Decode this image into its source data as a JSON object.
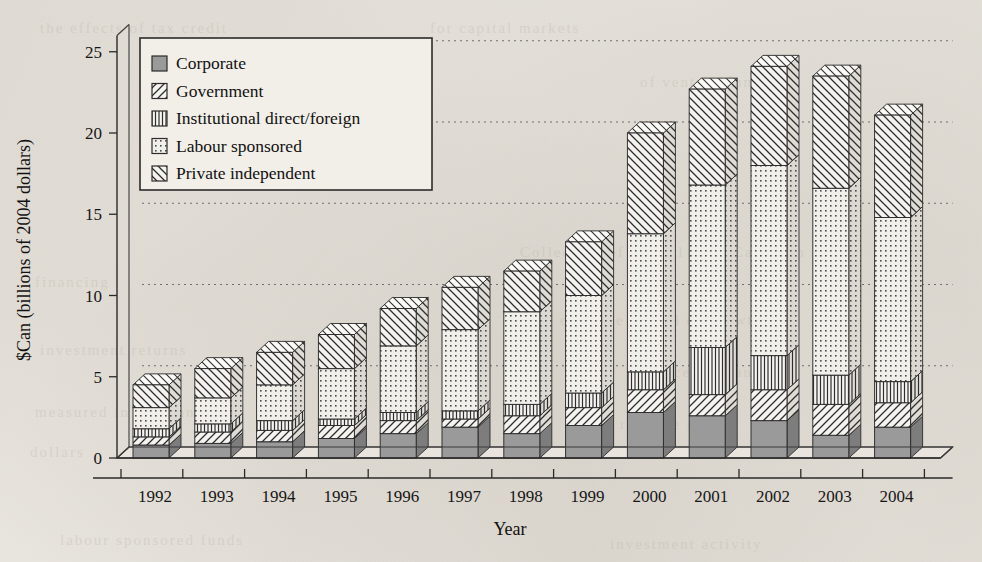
{
  "chart_data": {
    "type": "bar",
    "subtype": "stacked-bar-3d",
    "title": "",
    "xlabel": "Year",
    "ylabel": "$Can (billions of 2004 dollars)",
    "ylim": [
      0,
      26
    ],
    "yticks": [
      0,
      5,
      10,
      15,
      20,
      25
    ],
    "ytick_labels": [
      "0",
      "5",
      "10",
      "15",
      "20",
      "25"
    ],
    "grid": "horizontal-dotted",
    "legend_position": "top-left-inside",
    "categories": [
      "1992",
      "1993",
      "1994",
      "1995",
      "1996",
      "1997",
      "1998",
      "1999",
      "2000",
      "2001",
      "2002",
      "2003",
      "2004"
    ],
    "series": [
      {
        "name": "Corporate",
        "pattern": "solid-gray",
        "values": [
          0.8,
          0.9,
          1.0,
          1.2,
          1.5,
          1.9,
          1.5,
          2.0,
          2.8,
          2.6,
          2.3,
          1.4,
          1.9
        ]
      },
      {
        "name": "Government",
        "pattern": "diagonal-forward",
        "values": [
          0.5,
          0.7,
          0.7,
          0.8,
          0.8,
          0.5,
          1.1,
          1.1,
          1.4,
          1.3,
          1.9,
          1.9,
          1.5
        ]
      },
      {
        "name": "Institutional direct/foreign",
        "pattern": "vertical-bars",
        "values": [
          0.5,
          0.5,
          0.6,
          0.4,
          0.5,
          0.5,
          0.7,
          0.9,
          1.1,
          2.9,
          2.1,
          1.8,
          1.3
        ]
      },
      {
        "name": "Labour sponsored",
        "pattern": "dot-grid",
        "values": [
          1.3,
          1.6,
          2.2,
          3.1,
          4.1,
          5.0,
          5.7,
          6.0,
          8.5,
          10.0,
          11.7,
          11.5,
          10.1
        ]
      },
      {
        "name": "Private independent",
        "pattern": "diagonal-back",
        "values": [
          1.4,
          1.8,
          2.0,
          2.1,
          2.3,
          2.6,
          2.5,
          3.3,
          6.2,
          5.9,
          6.1,
          6.9,
          6.3
        ]
      }
    ],
    "totals": [
      4.5,
      5.5,
      6.5,
      7.6,
      9.2,
      10.5,
      11.5,
      13.3,
      20.0,
      22.7,
      24.1,
      23.5,
      21.1
    ]
  },
  "legend": {
    "entries": [
      {
        "label": "Corporate",
        "swatch": "solid-gray-swatch"
      },
      {
        "label": "Government",
        "swatch": "diagonal-forward-swatch"
      },
      {
        "label": "Institutional direct/foreign",
        "swatch": "vertical-bars-swatch"
      },
      {
        "label": "Labour sponsored",
        "swatch": "dot-grid-swatch"
      },
      {
        "label": "Private independent",
        "swatch": "diagonal-back-swatch"
      }
    ]
  },
  "colors": {
    "ink": "#1a1a1a",
    "paper": "#efece6",
    "corporate_fill": "#9a9a9a",
    "hatch_fill": "#f4f2ee",
    "grid": "#6f6f6f"
  }
}
